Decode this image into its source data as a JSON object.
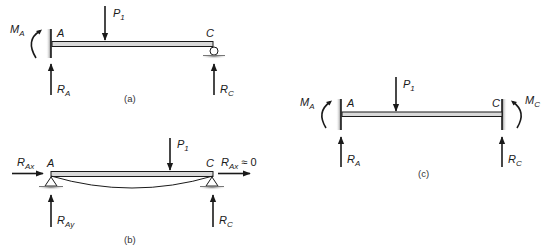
{
  "figure": {
    "panels": [
      {
        "id": "a",
        "caption": "(a)",
        "description": "Propped cantilever: fixed support at A, roller at C",
        "support_A": "fixed-wall",
        "support_C": "roller",
        "labels": {
          "load": {
            "main": "P",
            "sub": "1"
          },
          "moment_A": {
            "main": "M",
            "sub": "A"
          },
          "point_A": "A",
          "point_C": "C",
          "reaction_A": {
            "main": "R",
            "sub": "A"
          },
          "reaction_C": {
            "main": "R",
            "sub": "C"
          }
        }
      },
      {
        "id": "b",
        "caption": "(b)",
        "description": "Simply supported beam with pin supports at A and C, deflected shape shown",
        "support_A": "pin",
        "support_C": "pin",
        "labels": {
          "load": {
            "main": "P",
            "sub": "1"
          },
          "point_A": "A",
          "point_C": "C",
          "reaction_Ax": {
            "main": "R",
            "sub": "Ax"
          },
          "reaction_Ax_right": {
            "main": "R",
            "sub": "Ax",
            "suffix": " ≈ 0"
          },
          "reaction_Ay": {
            "main": "R",
            "sub": "Ay"
          },
          "reaction_C": {
            "main": "R",
            "sub": "C"
          }
        }
      },
      {
        "id": "c",
        "caption": "(c)",
        "description": "Fixed-fixed beam: walls at A and C",
        "support_A": "fixed-wall",
        "support_C": "fixed-wall",
        "labels": {
          "load": {
            "main": "P",
            "sub": "1"
          },
          "moment_A": {
            "main": "M",
            "sub": "A"
          },
          "moment_C": {
            "main": "M",
            "sub": "C"
          },
          "point_A": "A",
          "point_C": "C",
          "reaction_A": {
            "main": "R",
            "sub": "A"
          },
          "reaction_C": {
            "main": "R",
            "sub": "C"
          }
        }
      }
    ],
    "colors": {
      "ink": "#1a1a1a",
      "beam_fill": "#d9d9d9",
      "support_shade": "#8a8a8a"
    }
  }
}
